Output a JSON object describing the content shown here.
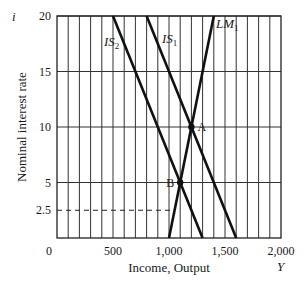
{
  "chart_data": {
    "type": "line",
    "title": "",
    "xlabel": "Income, Output",
    "xvar": "Y",
    "ylabel": "Nominal interest rate",
    "yvar": "i",
    "xlim": [
      0,
      2000
    ],
    "ylim": [
      0,
      20
    ],
    "x_ticks": [
      0,
      500,
      1000,
      1500,
      2000
    ],
    "x_tick_labels": [
      "0",
      "500",
      "1,000",
      "1,500",
      "2,000"
    ],
    "y_ticks": [
      2.5,
      5,
      10,
      15,
      20
    ],
    "y_tick_labels": [
      "2.5",
      "5",
      "10",
      "15",
      "20"
    ],
    "grid": {
      "vertical_step": 100,
      "horizontal": [
        5,
        10,
        15,
        20
      ]
    },
    "series": [
      {
        "name": "LM1",
        "label_main": "LM",
        "label_sub": "1",
        "points": [
          [
            1000,
            0
          ],
          [
            1400,
            20
          ]
        ]
      },
      {
        "name": "IS1",
        "label_main": "IS",
        "label_sub": "1",
        "points": [
          [
            800,
            20
          ],
          [
            1600,
            0
          ]
        ]
      },
      {
        "name": "IS2",
        "label_main": "IS",
        "label_sub": "2",
        "points": [
          [
            500,
            20
          ],
          [
            1300,
            0
          ]
        ]
      }
    ],
    "points": [
      {
        "label": "A",
        "x": 1200,
        "y": 10
      },
      {
        "label": "B",
        "x": 1100,
        "y": 5
      }
    ],
    "reference_lines": [
      {
        "style": "dashed",
        "y": 2.5,
        "x_from": 0,
        "x_to": 1050
      }
    ]
  }
}
